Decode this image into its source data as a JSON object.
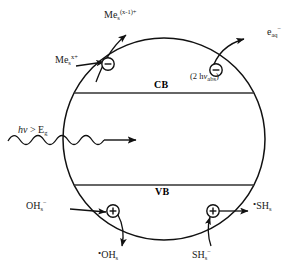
{
  "figure": {
    "type": "semiconductor-photocatalysis-scheme",
    "particle": {
      "shape": "circle",
      "bands": [
        {
          "id": "cb",
          "label": "CB",
          "description": "conduction band edge line"
        },
        {
          "id": "vb",
          "label": "VB",
          "description": "valence band edge line"
        }
      ]
    },
    "excitation": {
      "label_prefix": "h",
      "label_nu": "ν",
      "label_rel": " > E",
      "label_sub": "g",
      "full": "hν > Eg"
    },
    "two_photon": {
      "open": "(2 h",
      "nu": "ν",
      "sub": "abs",
      "close": ")",
      "full": "(2 hνabs )"
    },
    "carriers": [
      {
        "id": "electron-top-left",
        "sign": "−",
        "glyph": "minus-in-circle"
      },
      {
        "id": "electron-top-right",
        "sign": "−",
        "glyph": "minus-in-circle"
      },
      {
        "id": "hole-bottom-left",
        "sign": "+",
        "glyph": "plus-in-circle"
      },
      {
        "id": "hole-bottom-right",
        "sign": "+",
        "glyph": "plus-in-circle"
      }
    ],
    "species": {
      "me_ox_product": {
        "base": "Me",
        "sub": "s",
        "sup": "(x-1)+"
      },
      "me_reactant": {
        "base": "Me",
        "sub": "s",
        "sup": "x+"
      },
      "e_aq": {
        "base": "e",
        "sub": "aq",
        "sup": "−"
      },
      "oh_reactant": {
        "base": "OH",
        "sub": "s",
        "sup": "−"
      },
      "oh_radical": {
        "dot": "•",
        "base": "OH",
        "sub": "s",
        "sup": ""
      },
      "sh_reactant": {
        "base": "SH",
        "sub": "s",
        "sup": "−"
      },
      "sh_radical": {
        "dot": "•",
        "base": "SH",
        "sub": "s",
        "sup": ""
      }
    },
    "colors": {
      "stroke": "#111111",
      "background": "#ffffff",
      "band_line": "#333333"
    }
  }
}
